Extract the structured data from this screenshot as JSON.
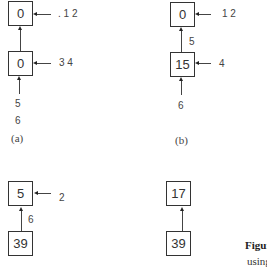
{
  "panels": {
    "a": {
      "caption": "(a)",
      "top_node": "0",
      "bottom_node": "0",
      "top_pointer_label": ". 1 2",
      "bottom_pointer_label": "3 4",
      "incoming_labels": [
        "5",
        "6"
      ]
    },
    "b": {
      "caption": "(b)",
      "top_node": "0",
      "bottom_node": "15",
      "top_pointer_label": "1 2",
      "bottom_pointer_label": "4",
      "edge_label": "5",
      "incoming_labels": [
        "6"
      ]
    },
    "c": {
      "top_node": "5",
      "bottom_node": "39",
      "top_pointer_label": "2",
      "edge_label": "6"
    },
    "d": {
      "top_node": "17",
      "bottom_node": "39"
    }
  },
  "figure_caption": {
    "label": "Figur",
    "text": "using"
  }
}
